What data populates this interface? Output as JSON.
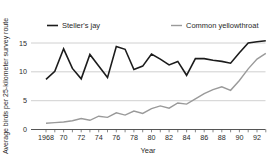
{
  "chart_data": {
    "type": "line",
    "title": "",
    "xlabel": "Year",
    "ylabel": "Average birds per 25-kilometer survey route",
    "x": [
      1968,
      1969,
      1970,
      1971,
      1972,
      1973,
      1974,
      1975,
      1976,
      1977,
      1978,
      1979,
      1980,
      1981,
      1982,
      1983,
      1984,
      1985,
      1986,
      1987,
      1988,
      1989,
      1990,
      1991,
      1992,
      1993
    ],
    "x_tick_labels": [
      "1968",
      "70",
      "72",
      "74",
      "76",
      "78",
      "80",
      "82",
      "84",
      "86",
      "88",
      "90",
      "92"
    ],
    "x_tick_years": [
      1968,
      1970,
      1972,
      1974,
      1976,
      1978,
      1980,
      1982,
      1984,
      1986,
      1988,
      1990,
      1992
    ],
    "yticks": [
      0,
      5,
      10,
      15
    ],
    "ylim": [
      0,
      16
    ],
    "grid": "horizontal",
    "legend_position": "top",
    "axis_color": "#555555",
    "grid_color": "#c4c4c4",
    "series": [
      {
        "name": "Steller's jay",
        "color": "#1c1c1c",
        "values": [
          8.7,
          10.1,
          14.0,
          10.6,
          8.8,
          13.0,
          11.0,
          9.0,
          14.4,
          13.9,
          10.4,
          11.0,
          13.1,
          12.2,
          11.2,
          11.8,
          9.4,
          12.3,
          12.3,
          12.0,
          11.8,
          11.5,
          13.3,
          15.0,
          15.2,
          15.4
        ]
      },
      {
        "name": "Common yellowthroat",
        "color": "#9a9a9a",
        "values": [
          1.1,
          1.2,
          1.3,
          1.5,
          1.9,
          1.6,
          2.3,
          2.1,
          2.9,
          2.5,
          3.2,
          2.8,
          3.6,
          4.1,
          3.7,
          4.6,
          4.4,
          5.3,
          6.2,
          6.9,
          7.4,
          6.8,
          8.5,
          10.5,
          12.2,
          13.2
        ]
      }
    ]
  }
}
